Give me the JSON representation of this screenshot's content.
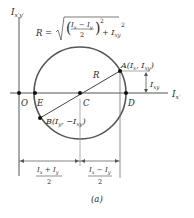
{
  "figure": {
    "caption": "(a)",
    "vertical_axis_label": "I",
    "vertical_axis_sub": "x′y′",
    "horizontal_axis_label": "I",
    "horizontal_axis_sub": "x′",
    "radius_formula": {
      "lhs": "R =",
      "num_a": "I",
      "num_a_sub": "x",
      "minus": " − ",
      "num_b": "I",
      "num_b_sub": "y",
      "den": "2",
      "sq": "2",
      "plus": "+ I",
      "plus_sub": "xy",
      "sq2": "2"
    },
    "points": {
      "O": "O",
      "E": "E",
      "C": "C",
      "D": "D",
      "A": "A(I",
      "A_sub1": "x",
      "A_mid": ", I",
      "A_sub2": "xy",
      "A_end": ")",
      "B": "B(I",
      "B_sub1": "y",
      "B_mid": ", −I",
      "B_sub2": "xy",
      "B_end": ")"
    },
    "radius_label": "R",
    "ixy_dim": {
      "label": "I",
      "sub": "xy"
    },
    "dim_left": {
      "num": "I",
      "num_sub1": "x",
      "plus": " + I",
      "num_sub2": "y",
      "den": "2"
    },
    "dim_right": {
      "num": "I",
      "num_sub1": "x",
      "minus": " − I",
      "num_sub2": "y",
      "den": "2"
    }
  }
}
